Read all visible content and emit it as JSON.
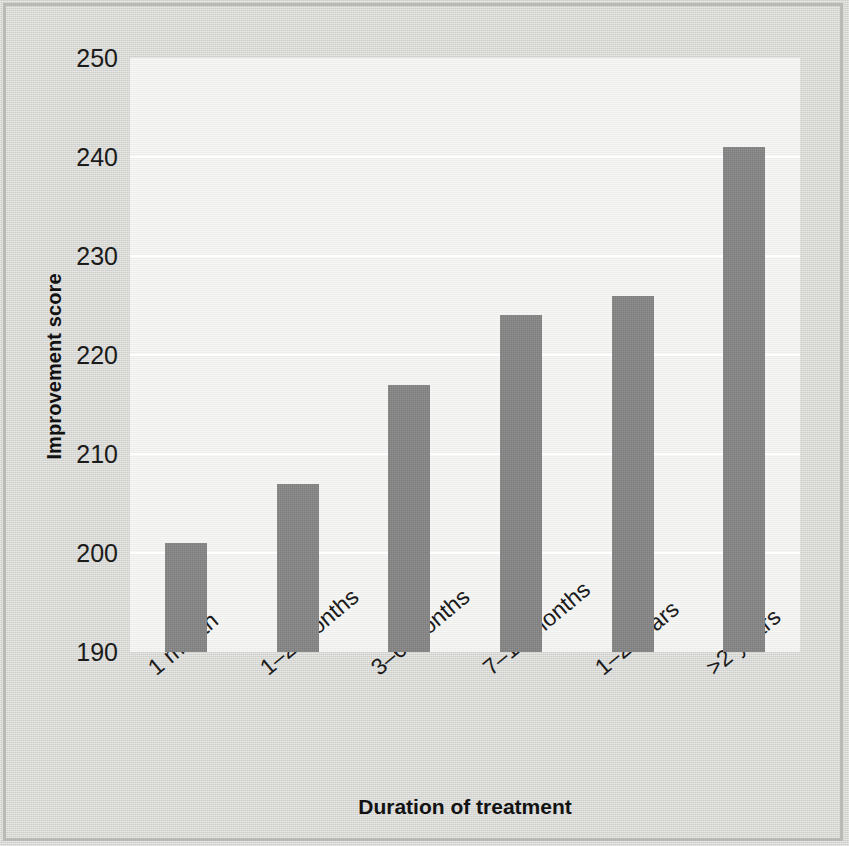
{
  "chart_data": {
    "type": "bar",
    "title": "",
    "xlabel": "Duration of treatment",
    "ylabel": "Improvement score",
    "categories": [
      "1 month",
      "1–2 months",
      "3–6 months",
      "7–11 months",
      "1–2 years",
      ">2 years"
    ],
    "values": [
      201,
      207,
      217,
      224,
      226,
      241
    ],
    "ylim": [
      190,
      250
    ],
    "yticks": [
      190,
      200,
      210,
      220,
      230,
      240,
      250
    ],
    "ytick_labels": [
      "190",
      "200",
      "210",
      "220",
      "230",
      "240",
      "250"
    ],
    "grid": "horizontal-only",
    "legend": "none",
    "bar_color": "#848484",
    "panel_color": "#efefed",
    "gridline_color": "#ffffff",
    "text_color": "#1b1b1b"
  },
  "axes": {
    "y_title": "Improvement score",
    "x_title": "Duration of treatment"
  }
}
